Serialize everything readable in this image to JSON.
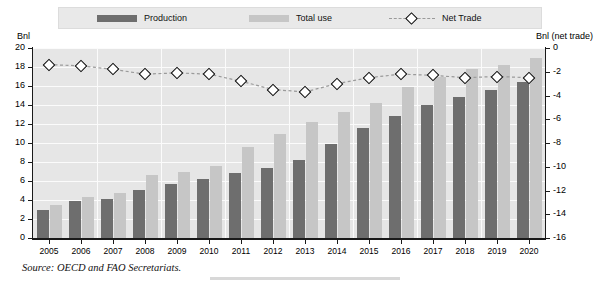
{
  "legend": {
    "items": [
      {
        "key": "production",
        "label": "Production",
        "color": "#6e6e6e",
        "marker": "filled-rect"
      },
      {
        "key": "total_use",
        "label": "Total use",
        "color": "#c6c6c6",
        "marker": "filled-rect"
      },
      {
        "key": "net_trade",
        "label": "Net Trade",
        "color": "#000000",
        "marker": "dashed-line-diamond"
      }
    ]
  },
  "axes": {
    "left_unit": "Bnl",
    "right_unit": "Bnl (net trade)"
  },
  "source": {
    "label": "Source:",
    "text": "OECD and FAO Secretariats.",
    "full": "Source:  OECD and FAO Secretariats."
  },
  "chart_data": {
    "type": "bar",
    "title": "",
    "xlabel": "",
    "ylabel": "Bnl",
    "y2label": "Bnl (net trade)",
    "ylim": [
      0,
      20
    ],
    "y2lim": [
      -16,
      0
    ],
    "yticks": [
      0,
      2,
      4,
      6,
      8,
      10,
      12,
      14,
      16,
      18,
      20
    ],
    "y2ticks": [
      0,
      -2,
      -4,
      -6,
      -8,
      -10,
      -12,
      -14,
      -16
    ],
    "ytick_labels": [
      "0",
      "2",
      "4",
      "6",
      "8",
      "10",
      "12",
      "14",
      "16",
      "18",
      "20"
    ],
    "y2tick_labels": [
      "0",
      "-2",
      "-4",
      "-6",
      "-8",
      "-10",
      "-12",
      "-14",
      "-16"
    ],
    "grid": true,
    "legend_position": "top",
    "categories": [
      "2005",
      "2006",
      "2007",
      "2008",
      "2009",
      "2010",
      "2011",
      "2012",
      "2013",
      "2014",
      "2015",
      "2016",
      "2017",
      "2018",
      "2019",
      "2020"
    ],
    "series": [
      {
        "name": "Production",
        "kind": "bar",
        "axis": "left",
        "color": "#6e6e6e",
        "values": [
          3.0,
          3.9,
          4.1,
          5.1,
          5.7,
          6.2,
          6.8,
          7.4,
          8.2,
          9.9,
          11.6,
          12.8,
          14.0,
          14.8,
          15.6,
          16.4
        ]
      },
      {
        "name": "Total use",
        "kind": "bar",
        "axis": "left",
        "color": "#c6c6c6",
        "values": [
          3.5,
          4.3,
          4.7,
          6.6,
          6.9,
          7.6,
          9.6,
          11.0,
          12.2,
          13.3,
          14.2,
          15.9,
          16.9,
          17.8,
          18.2,
          19.0
        ]
      },
      {
        "name": "Net Trade",
        "kind": "line",
        "axis": "right",
        "color": "#000000",
        "linestyle": "dashed",
        "marker": "diamond",
        "values": [
          -1.4,
          -1.5,
          -1.8,
          -2.2,
          -2.1,
          -2.2,
          -2.8,
          -3.5,
          -3.7,
          -3.0,
          -2.5,
          -2.2,
          -2.3,
          -2.5,
          -2.4,
          -2.5
        ]
      }
    ]
  }
}
